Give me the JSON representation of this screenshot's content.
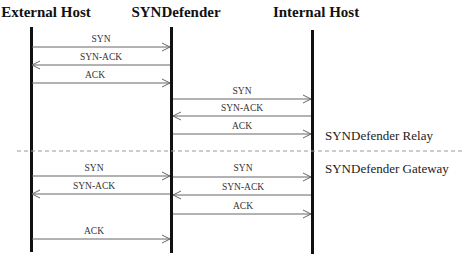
{
  "diagram": {
    "type": "sequence",
    "actors": [
      {
        "id": "ext",
        "label": "External Host",
        "x": 31
      },
      {
        "id": "syn",
        "label": "SYNDefender",
        "x": 172
      },
      {
        "id": "int",
        "label": "Internal Host",
        "x": 312
      }
    ],
    "phases": [
      {
        "label": "SYNDefender Relay"
      },
      {
        "label": "SYNDefender Gateway"
      }
    ],
    "messages": [
      {
        "label": "SYN",
        "from": "ext",
        "to": "syn",
        "y": 47
      },
      {
        "label": "SYN-ACK",
        "from": "syn",
        "to": "ext",
        "y": 65
      },
      {
        "label": "ACK",
        "from": "ext",
        "to": "syn",
        "y": 83
      },
      {
        "label": "SYN",
        "from": "syn",
        "to": "int",
        "y": 99
      },
      {
        "label": "SYN-ACK",
        "from": "int",
        "to": "syn",
        "y": 116
      },
      {
        "label": "ACK",
        "from": "syn",
        "to": "int",
        "y": 134
      },
      {
        "label": "SYN",
        "from": "ext",
        "to": "syn",
        "y": 176
      },
      {
        "label": "SYN",
        "from": "syn",
        "to": "int",
        "y": 176
      },
      {
        "label": "SYN-ACK",
        "from": "syn",
        "to": "ext",
        "y": 194
      },
      {
        "label": "SYN-ACK",
        "from": "int",
        "to": "syn",
        "y": 195
      },
      {
        "label": "ACK",
        "from": "syn",
        "to": "int",
        "y": 213
      },
      {
        "label": "ACK",
        "from": "ext",
        "to": "syn",
        "y": 240
      }
    ]
  }
}
